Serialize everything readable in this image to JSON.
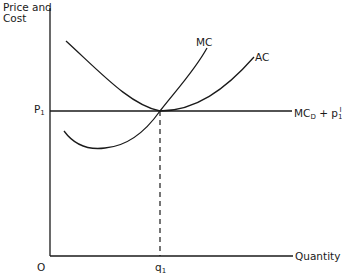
{
  "diagram": {
    "y_axis_label_line1": "Price  and",
    "y_axis_label_line2": "Cost",
    "x_axis_label": "Quantity",
    "origin_label": "O",
    "price_label": "P",
    "price_sub": "1",
    "quantity_label": "q",
    "quantity_sub": "1",
    "curves": {
      "mc_label": "MC",
      "ac_label": "AC",
      "line_label": "MC",
      "line_label_sub": "D",
      "line_label_plus": " + p",
      "line_label_p_sub": "1",
      "line_label_p_sup": "I"
    },
    "colors": {
      "line": "#1a1a1a",
      "background": "#ffffff"
    }
  }
}
